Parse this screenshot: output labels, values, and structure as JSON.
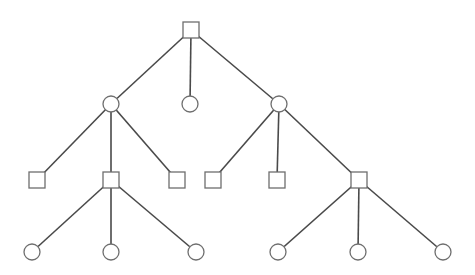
{
  "diagram": {
    "type": "tree",
    "width": 475,
    "height": 275,
    "colors": {
      "edge": "#4a4a4a",
      "node_stroke": "#6e6e6e",
      "node_fill": "#ffffff",
      "background": "#ffffff"
    },
    "node_size": 16,
    "nodes": [
      {
        "id": "root",
        "shape": "square",
        "x": 191,
        "y": 30
      },
      {
        "id": "c1",
        "shape": "circle",
        "x": 111,
        "y": 104
      },
      {
        "id": "c2",
        "shape": "circle",
        "x": 190,
        "y": 104
      },
      {
        "id": "c3",
        "shape": "circle",
        "x": 279,
        "y": 104
      },
      {
        "id": "s1",
        "shape": "square",
        "x": 37,
        "y": 180
      },
      {
        "id": "s2",
        "shape": "square",
        "x": 111,
        "y": 180
      },
      {
        "id": "s3",
        "shape": "square",
        "x": 177,
        "y": 180
      },
      {
        "id": "s4",
        "shape": "square",
        "x": 213,
        "y": 180
      },
      {
        "id": "s5",
        "shape": "square",
        "x": 277,
        "y": 180
      },
      {
        "id": "s6",
        "shape": "square",
        "x": 359,
        "y": 180
      },
      {
        "id": "l1",
        "shape": "circle",
        "x": 32,
        "y": 252
      },
      {
        "id": "l2",
        "shape": "circle",
        "x": 111,
        "y": 252
      },
      {
        "id": "l3",
        "shape": "circle",
        "x": 196,
        "y": 252
      },
      {
        "id": "l4",
        "shape": "circle",
        "x": 278,
        "y": 252
      },
      {
        "id": "l5",
        "shape": "circle",
        "x": 358,
        "y": 252
      },
      {
        "id": "l6",
        "shape": "circle",
        "x": 443,
        "y": 252
      }
    ],
    "edges": [
      [
        "root",
        "c1"
      ],
      [
        "root",
        "c2"
      ],
      [
        "root",
        "c3"
      ],
      [
        "c1",
        "s1"
      ],
      [
        "c1",
        "s2"
      ],
      [
        "c1",
        "s3"
      ],
      [
        "c3",
        "s4"
      ],
      [
        "c3",
        "s5"
      ],
      [
        "c3",
        "s6"
      ],
      [
        "s2",
        "l1"
      ],
      [
        "s2",
        "l2"
      ],
      [
        "s2",
        "l3"
      ],
      [
        "s6",
        "l4"
      ],
      [
        "s6",
        "l5"
      ],
      [
        "s6",
        "l6"
      ]
    ]
  }
}
